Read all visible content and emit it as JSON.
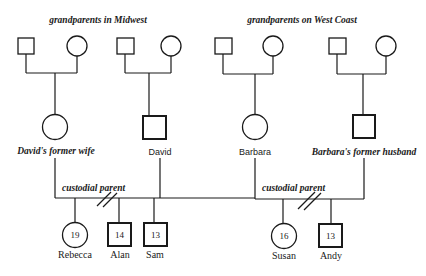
{
  "title_left": "grandparents in Midwest",
  "title_right": "grandparents on West Coast",
  "parents": {
    "former_wife": "David's former wife",
    "david": "David",
    "barbara": "Barbara",
    "former_husband": "Barbara's former husband"
  },
  "custodial_label_left": "custodial parent",
  "custodial_label_right": "custodial parent",
  "children": [
    {
      "name": "Rebecca",
      "age": "19",
      "sex": "female"
    },
    {
      "name": "Alan",
      "age": "14",
      "sex": "male"
    },
    {
      "name": "Sam",
      "age": "13",
      "sex": "male"
    },
    {
      "name": "Susan",
      "age": "16",
      "sex": "female"
    },
    {
      "name": "Andy",
      "age": "13",
      "sex": "male"
    }
  ],
  "symbols": {
    "square": "male",
    "circle": "female",
    "double-slash": "divorce"
  }
}
